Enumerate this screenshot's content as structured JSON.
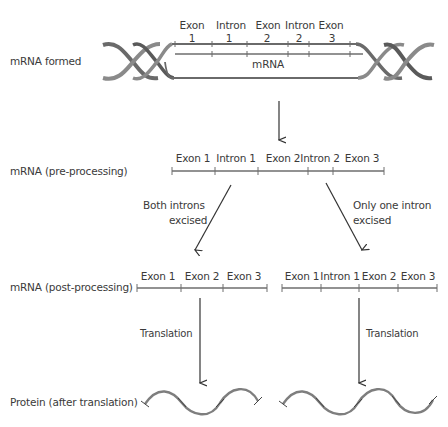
{
  "title": "",
  "rows": {
    "formed": "mRNA formed",
    "pre": "mRNA (pre-processing)",
    "post": "mRNA (post-processing)",
    "protein": "Protein (after translation)"
  },
  "dna": {
    "segments_top": [
      "Exon",
      "Intron",
      "Exon",
      "Intron",
      "Exon"
    ],
    "segments_num": [
      "1",
      "1",
      "2",
      "2",
      "3"
    ],
    "mrna_label": "mRNA"
  },
  "pre_processing": {
    "segments": [
      "Exon 1",
      "Intron 1",
      "Exon 2",
      "Intron 2",
      "Exon 3"
    ]
  },
  "branches": {
    "left": {
      "line1": "Both introns",
      "line2": "excised"
    },
    "right": {
      "line1": "Only one intron",
      "line2": "excised"
    }
  },
  "post_processing": {
    "left_segments": [
      "Exon 1",
      "Exon 2",
      "Exon 3"
    ],
    "right_segments": [
      "Exon 1",
      "Intron 1",
      "Exon 2",
      "Exon 3"
    ]
  },
  "translation": {
    "left": "Translation",
    "right": "Translation"
  },
  "colors": {
    "line": "#7a7a7a",
    "dna_dark": "#5a5a5a",
    "dna_light": "#9a9a9a",
    "text": "#3a3a3a"
  }
}
